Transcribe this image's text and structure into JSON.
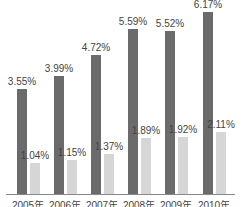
{
  "chart_data": {
    "type": "bar",
    "title": "",
    "xlabel": "",
    "ylabel": "",
    "categories": [
      "2005年",
      "2006年",
      "2007年",
      "2008年",
      "2009年",
      "2010年"
    ],
    "series": [
      {
        "name": "series-1",
        "color": "#6b6b6b",
        "values": [
          3.55,
          3.99,
          4.72,
          5.59,
          5.52,
          6.17
        ],
        "labels": [
          "3.55%",
          "3.99%",
          "4.72%",
          "5.59%",
          "5.52%",
          "6.17%"
        ]
      },
      {
        "name": "series-2",
        "color": "#d6d6d6",
        "values": [
          1.04,
          1.15,
          1.37,
          1.89,
          1.92,
          2.11
        ],
        "labels": [
          "1.04%",
          "1.15%",
          "1.37%",
          "1.89%",
          "1.92%",
          "2.11%"
        ]
      }
    ],
    "grid": false,
    "legend": "none",
    "ylim": [
      0,
      6.5
    ]
  }
}
